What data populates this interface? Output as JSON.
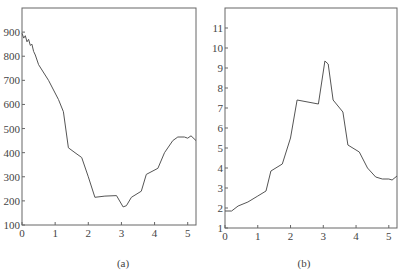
{
  "chart_data": [
    {
      "type": "line",
      "caption": "(a)",
      "title": "",
      "xlabel": "",
      "ylabel": "",
      "xlim": [
        0,
        5.25
      ],
      "ylim": [
        100,
        1000
      ],
      "x_ticks": [
        0,
        1,
        2,
        3,
        4,
        5
      ],
      "y_ticks": [
        100,
        200,
        300,
        400,
        500,
        600,
        700,
        800,
        900
      ],
      "grid": false,
      "legend": null,
      "x": [
        0,
        0.05,
        0.1,
        0.15,
        0.2,
        0.25,
        0.3,
        0.35,
        0.4,
        0.5,
        0.8,
        1.1,
        1.25,
        1.4,
        1.6,
        1.8,
        2.0,
        2.2,
        2.5,
        2.85,
        3.05,
        3.15,
        3.3,
        3.6,
        3.75,
        4.1,
        4.3,
        4.55,
        4.7,
        4.9,
        5.0,
        5.1,
        5.25
      ],
      "values": [
        895,
        875,
        885,
        860,
        870,
        845,
        850,
        820,
        805,
        765,
        700,
        620,
        570,
        420,
        400,
        380,
        300,
        215,
        220,
        222,
        175,
        180,
        215,
        240,
        310,
        335,
        400,
        450,
        465,
        465,
        460,
        470,
        450
      ]
    },
    {
      "type": "line",
      "caption": "(b)",
      "title": "",
      "xlabel": "",
      "ylabel": "",
      "xlim": [
        0,
        5.25
      ],
      "ylim": [
        1,
        12
      ],
      "x_ticks": [
        0,
        1,
        2,
        3,
        4,
        5
      ],
      "y_ticks": [
        1,
        2,
        3,
        4,
        5,
        6,
        7,
        8,
        9,
        10,
        11
      ],
      "grid": false,
      "legend": null,
      "x": [
        0,
        0.2,
        0.4,
        0.7,
        1.0,
        1.25,
        1.4,
        1.75,
        2.0,
        2.2,
        2.85,
        3.05,
        3.15,
        3.3,
        3.6,
        3.75,
        4.1,
        4.35,
        4.6,
        4.8,
        5.0,
        5.1,
        5.25
      ],
      "values": [
        1.85,
        1.85,
        2.1,
        2.3,
        2.6,
        2.85,
        3.85,
        4.2,
        5.5,
        7.4,
        7.2,
        9.35,
        9.2,
        7.4,
        6.8,
        5.15,
        4.8,
        4.0,
        3.55,
        3.45,
        3.45,
        3.4,
        3.6
      ]
    }
  ]
}
